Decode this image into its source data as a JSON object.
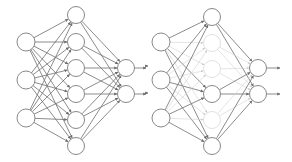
{
  "colors": {
    "background": "#ffffff",
    "active_edge": "#6e6e6e",
    "active_node": "#7a7a7a",
    "dropped": "#d2d2d2"
  },
  "networks": [
    {
      "name": "standard-network",
      "layers": {
        "input": {
          "x": 26,
          "r": 9,
          "y": [
            42,
            80,
            118
          ],
          "active": [
            true,
            true,
            true
          ]
        },
        "hidden": {
          "x": 76,
          "r": 8.5,
          "y": [
            15,
            42,
            68,
            94,
            120,
            146
          ],
          "active": [
            true,
            true,
            true,
            true,
            true,
            true
          ]
        },
        "output": {
          "x": 126,
          "r": 8.5,
          "y": [
            68,
            94
          ],
          "active": [
            true,
            true
          ]
        }
      },
      "input_arrows": false,
      "output_arrow_end": 146
    },
    {
      "name": "dropout-network",
      "layers": {
        "input": {
          "x": 161,
          "r": 9,
          "y": [
            42,
            80,
            118
          ],
          "active": [
            true,
            true,
            true
          ]
        },
        "hidden": {
          "x": 212,
          "r": 8.5,
          "y": [
            17,
            43,
            69,
            94,
            120,
            146
          ],
          "active": [
            true,
            false,
            false,
            true,
            false,
            true
          ]
        },
        "output": {
          "x": 258,
          "r": 8.5,
          "y": [
            68,
            94
          ],
          "active": [
            true,
            true
          ]
        }
      },
      "input_arrows": true,
      "output_arrow_end": 280
    }
  ]
}
